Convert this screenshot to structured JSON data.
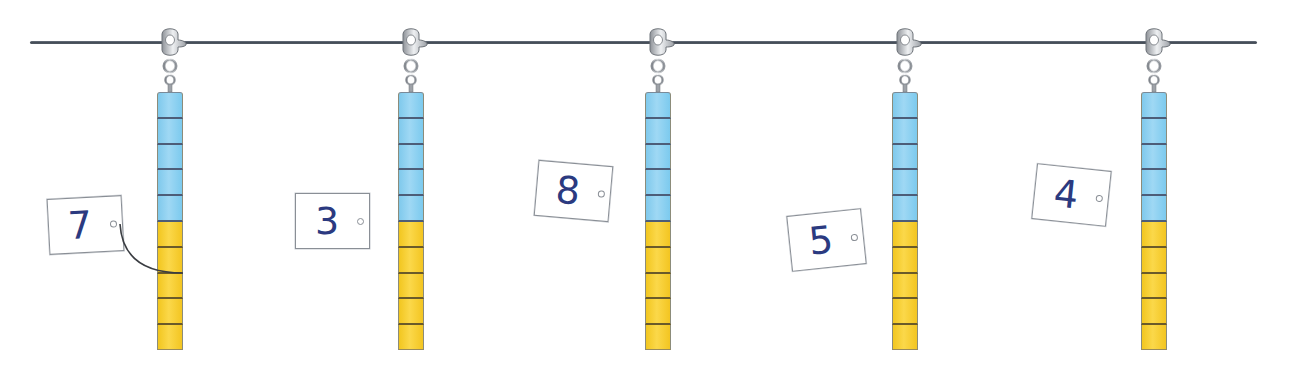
{
  "scene": {
    "description": "Five towers of connecting cubes hanging from a string on clasps, each with a number card",
    "colors": {
      "string": "#3e4650",
      "blue_cube": "#8fd1f1",
      "yellow_cube": "#f7cf36",
      "card_digit": "#2b3a80",
      "clasp": "#c9ccd0"
    }
  },
  "towers": [
    {
      "id": 1,
      "center_x": 170,
      "blue_count": 5,
      "yellow_count": 5,
      "card": {
        "number": "7",
        "x": 48,
        "y": 197,
        "rotate": -3,
        "attached": true
      }
    },
    {
      "id": 2,
      "center_x": 411,
      "blue_count": 5,
      "yellow_count": 5,
      "card": {
        "number": "3",
        "x": 295,
        "y": 193,
        "rotate": 0,
        "attached": false
      }
    },
    {
      "id": 3,
      "center_x": 658,
      "blue_count": 5,
      "yellow_count": 5,
      "card": {
        "number": "8",
        "x": 536,
        "y": 163,
        "rotate": 5,
        "attached": false
      }
    },
    {
      "id": 4,
      "center_x": 905,
      "blue_count": 5,
      "yellow_count": 5,
      "card": {
        "number": "5",
        "x": 789,
        "y": 212,
        "rotate": -6,
        "attached": false
      }
    },
    {
      "id": 5,
      "center_x": 1154,
      "blue_count": 5,
      "yellow_count": 5,
      "card": {
        "number": "4",
        "x": 1034,
        "y": 167,
        "rotate": 6,
        "attached": false
      }
    }
  ]
}
